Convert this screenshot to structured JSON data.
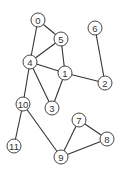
{
  "graph": {
    "nodes": [
      {
        "id": "0",
        "label": "0",
        "x": 38,
        "y": 20
      },
      {
        "id": "1",
        "label": "1",
        "x": 65,
        "y": 73
      },
      {
        "id": "2",
        "label": "2",
        "x": 105,
        "y": 83
      },
      {
        "id": "3",
        "label": "3",
        "x": 52,
        "y": 108
      },
      {
        "id": "4",
        "label": "4",
        "x": 30,
        "y": 62
      },
      {
        "id": "5",
        "label": "5",
        "x": 61,
        "y": 39
      },
      {
        "id": "6",
        "label": "6",
        "x": 95,
        "y": 28
      },
      {
        "id": "7",
        "label": "7",
        "x": 79,
        "y": 120
      },
      {
        "id": "8",
        "label": "8",
        "x": 107,
        "y": 139
      },
      {
        "id": "9",
        "label": "9",
        "x": 61,
        "y": 157
      },
      {
        "id": "10",
        "label": "10",
        "x": 23,
        "y": 104
      },
      {
        "id": "11",
        "label": "11",
        "x": 14,
        "y": 146
      }
    ],
    "edges": [
      [
        "0",
        "5"
      ],
      [
        "0",
        "4"
      ],
      [
        "5",
        "4"
      ],
      [
        "5",
        "1"
      ],
      [
        "4",
        "1"
      ],
      [
        "4",
        "3"
      ],
      [
        "4",
        "10"
      ],
      [
        "1",
        "3"
      ],
      [
        "1",
        "2"
      ],
      [
        "2",
        "6"
      ],
      [
        "10",
        "11"
      ],
      [
        "10",
        "9"
      ],
      [
        "9",
        "7"
      ],
      [
        "9",
        "8"
      ],
      [
        "7",
        "8"
      ]
    ],
    "node_radius": 7,
    "colors": {
      "stroke": "#444444",
      "fill": "#ffffff",
      "text": "#333333"
    }
  }
}
